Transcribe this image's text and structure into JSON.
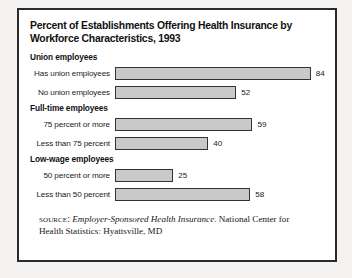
{
  "figure": {
    "title": "Percent of Establishments Offering Health Insurance by\nWorkforce Characteristics, 1993",
    "source_label": "SOURCE:",
    "source_title": "Employer-Sponsored Health Insurance.",
    "source_rest": " National Center for Health Statistics: Hyattsville, MD"
  },
  "chart_data": {
    "type": "bar",
    "orientation": "horizontal",
    "title": "Percent of Establishments Offering Health Insurance by Workforce Characteristics, 1993",
    "xlabel": "",
    "ylabel": "",
    "xlim": [
      0,
      100
    ],
    "grid": false,
    "legend": "none",
    "value_labels": true,
    "units": "percent",
    "groups": [
      {
        "name": "Union employees",
        "categories": [
          "Has union employees",
          "No union employees"
        ],
        "values": [
          84,
          52
        ]
      },
      {
        "name": "Full-time employees",
        "categories": [
          "75 percent or more",
          "Less than 75 percent"
        ],
        "values": [
          59,
          40
        ]
      },
      {
        "name": "Low-wage employees",
        "categories": [
          "50 percent or more",
          "Less than 50 percent"
        ],
        "values": [
          25,
          58
        ]
      }
    ],
    "categories": [
      "Has union employees",
      "No union employees",
      "75 percent or more",
      "Less than 75 percent",
      "50 percent or more",
      "Less than 50 percent"
    ],
    "values": [
      84,
      52,
      59,
      40,
      25,
      58
    ],
    "colors": {
      "bar_fill": "#c9c9c9",
      "bar_border": "#333333",
      "frame": "#2b2b2b",
      "text": "#111111",
      "background": "#ffffff"
    }
  }
}
